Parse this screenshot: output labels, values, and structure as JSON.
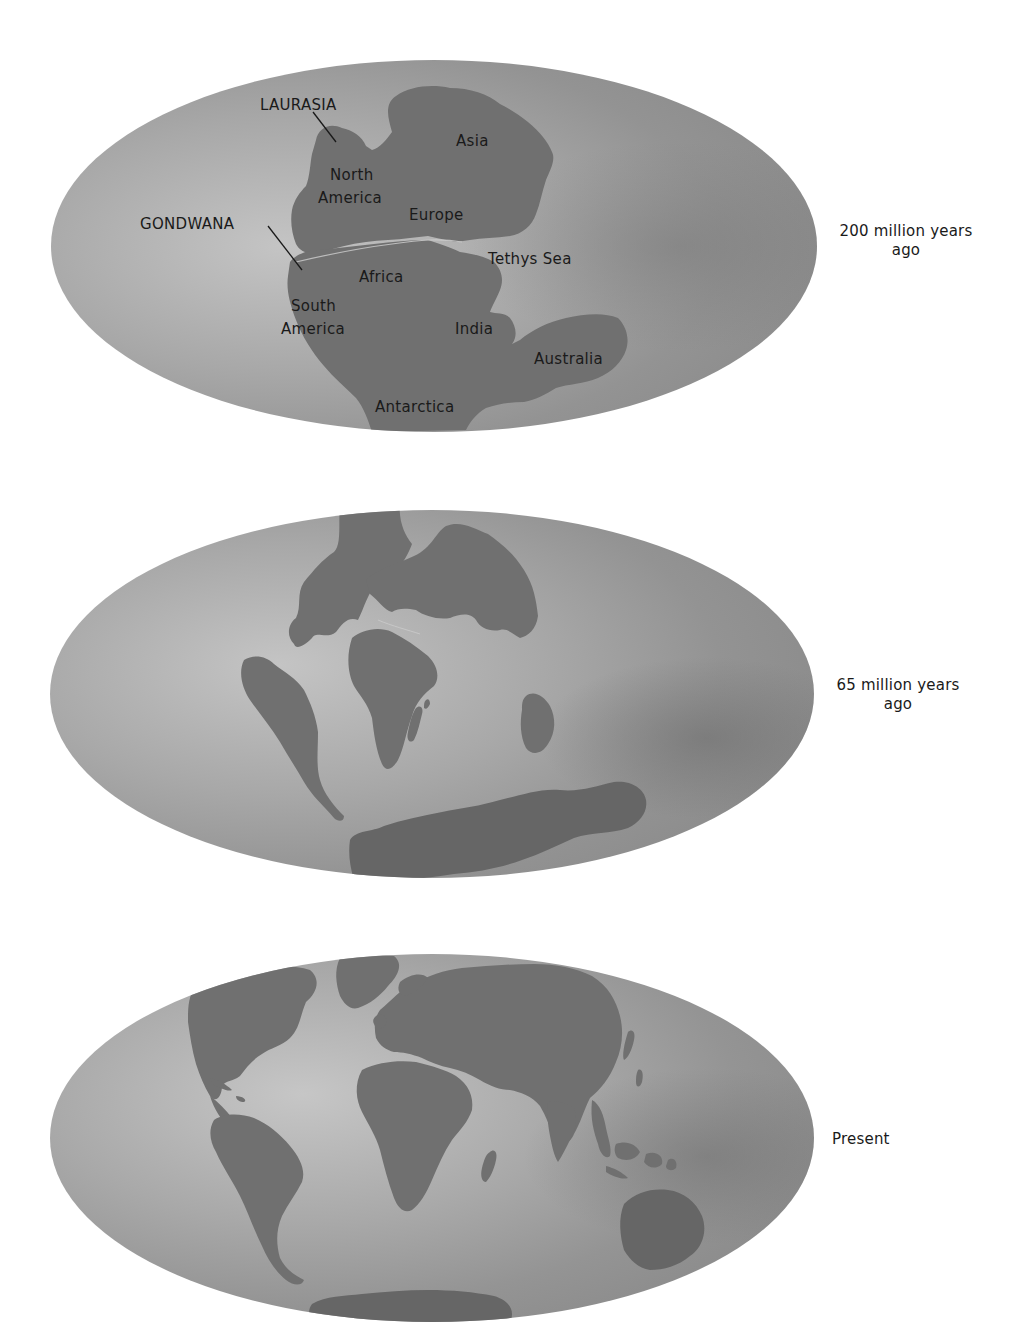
{
  "figure": {
    "panels": [
      {
        "id": "p200",
        "era_label_line1": "200 million years",
        "era_label_line2": "ago",
        "map_labels": {
          "laurasia": "LAURASIA",
          "gondwana": "GONDWANA",
          "asia": "Asia",
          "north_america_1": "North",
          "north_america_2": "America",
          "europe": "Europe",
          "tethys_sea": "Tethys Sea",
          "africa": "Africa",
          "south_america_1": "South",
          "south_america_2": "America",
          "india": "India",
          "australia": "Australia",
          "antarctica": "Antarctica"
        }
      },
      {
        "id": "p65",
        "era_label_line1": "65 million years",
        "era_label_line2": "ago"
      },
      {
        "id": "present",
        "era_label_line1": "Present",
        "era_label_line2": ""
      }
    ],
    "colors": {
      "ocean_light": "#c2c2c2",
      "ocean_mid": "#9e9e9e",
      "ocean_dark": "#7c7c7c",
      "land": "#707070",
      "text": "#1a1a1a",
      "background": "#ffffff"
    }
  }
}
